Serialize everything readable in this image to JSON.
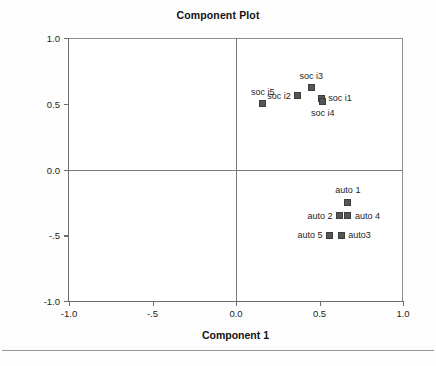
{
  "chart_data": {
    "type": "scatter",
    "title": "Component Plot",
    "xlabel": "Component 1",
    "ylabel": "Component 2",
    "xlim": [
      -1.0,
      1.0
    ],
    "ylim": [
      -1.0,
      1.0
    ],
    "xticks": [
      -1.0,
      -0.5,
      0.0,
      0.5,
      1.0
    ],
    "xticklabels": [
      "-1.0",
      "-.5",
      "0.0",
      "0.5",
      "1.0"
    ],
    "yticks": [
      -1.0,
      -0.5,
      0.0,
      0.5,
      1.0
    ],
    "yticklabels": [
      "-1.0",
      "-.5",
      "0.0",
      "0.5",
      "1.0"
    ],
    "grid": false,
    "legend": "none",
    "zero_lines": true,
    "marker_color": "#565656",
    "points": [
      {
        "label": "soc i5",
        "x": 0.16,
        "y": 0.5,
        "label_pos": "above"
      },
      {
        "label": "soc i2",
        "x": 0.37,
        "y": 0.56,
        "label_pos": "left"
      },
      {
        "label": "soc i3",
        "x": 0.45,
        "y": 0.62,
        "label_pos": "above"
      },
      {
        "label": "soc i1",
        "x": 0.51,
        "y": 0.54,
        "label_pos": "right"
      },
      {
        "label": "soc i4",
        "x": 0.52,
        "y": 0.52,
        "label_pos": "below"
      },
      {
        "label": "auto 1",
        "x": 0.67,
        "y": -0.25,
        "label_pos": "above"
      },
      {
        "label": "auto 2",
        "x": 0.62,
        "y": -0.35,
        "label_pos": "left"
      },
      {
        "label": "auto 4",
        "x": 0.67,
        "y": -0.35,
        "label_pos": "right"
      },
      {
        "label": "auto 5",
        "x": 0.56,
        "y": -0.5,
        "label_pos": "left"
      },
      {
        "label": "auto3",
        "x": 0.63,
        "y": -0.5,
        "label_pos": "right"
      }
    ]
  }
}
